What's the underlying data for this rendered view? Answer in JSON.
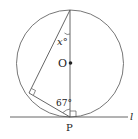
{
  "diagram": {
    "labels": {
      "angle_x": "x°",
      "center": "O",
      "angle_67": "67°",
      "point_p": "P",
      "line_l": "l"
    },
    "colors": {
      "stroke": "#555555",
      "text": "#222222"
    }
  }
}
